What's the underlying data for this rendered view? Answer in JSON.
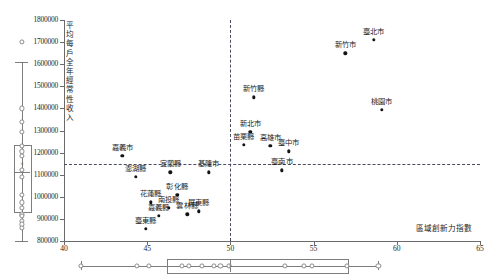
{
  "chart_data": {
    "type": "scatter",
    "title": "",
    "xlabel": "區域創新力指數",
    "ylabel": "平均每戶全年經常性收入",
    "xlim": [
      40,
      65
    ],
    "ylim": [
      800000,
      1800000
    ],
    "xticks": [
      40,
      45,
      50,
      55,
      60,
      65
    ],
    "yticks": [
      800000,
      900000,
      1000000,
      1100000,
      1200000,
      1300000,
      1400000,
      1500000,
      1600000,
      1700000,
      1800000
    ],
    "grid": false,
    "legend": "none",
    "reference_lines": {
      "horizontal_y": 1150000,
      "vertical_x": 50,
      "style": "dashed"
    },
    "points": [
      {
        "label": "臺北市",
        "x": 58.6,
        "y": 1710000
      },
      {
        "label": "新竹市",
        "x": 56.9,
        "y": 1650000
      },
      {
        "label": "桃園市",
        "x": 59.1,
        "y": 1395000
      },
      {
        "label": "新竹縣",
        "x": 51.4,
        "y": 1450000
      },
      {
        "label": "新北市",
        "x": 51.2,
        "y": 1295000
      },
      {
        "label": "苗栗縣",
        "x": 50.8,
        "y": 1235000
      },
      {
        "label": "高雄市",
        "x": 52.4,
        "y": 1230000
      },
      {
        "label": "臺中市",
        "x": 53.5,
        "y": 1205000
      },
      {
        "label": "臺南市",
        "x": 53.1,
        "y": 1120000
      },
      {
        "label": "基隆市",
        "x": 48.7,
        "y": 1110000
      },
      {
        "label": "嘉義市",
        "x": 43.5,
        "y": 1185000
      },
      {
        "label": "澎湖縣",
        "x": 44.3,
        "y": 1090000
      },
      {
        "label": "宜蘭縣",
        "x": 46.4,
        "y": 1110000
      },
      {
        "label": "彰化縣",
        "x": 46.8,
        "y": 1010000
      },
      {
        "label": "花蓮縣",
        "x": 45.2,
        "y": 975000
      },
      {
        "label": "南投縣",
        "x": 46.3,
        "y": 950000
      },
      {
        "label": "嘉義縣",
        "x": 45.7,
        "y": 915000
      },
      {
        "label": "雲林縣",
        "x": 47.4,
        "y": 920000
      },
      {
        "label": "屏東縣",
        "x": 48.1,
        "y": 935000
      },
      {
        "label": "臺東縣",
        "x": 44.9,
        "y": 855000
      }
    ],
    "y_marginal_boxplot": {
      "name": "income-boxplot",
      "min_whisker": 800000,
      "q1": 935000,
      "median": 1110000,
      "q3": 1235000,
      "max_whisker": 1610000,
      "mean": 1150000,
      "mean_marker": "×",
      "outliers": [
        1700000,
        1400000,
        1340000,
        1295000,
        1230000,
        1205000,
        1185000,
        1120000,
        1090000,
        1010000,
        975000,
        950000,
        920000,
        915000,
        890000,
        875000,
        860000
      ]
    },
    "x_marginal_boxplot": {
      "name": "innovation-index-boxplot",
      "min_whisker": 41.0,
      "q1": 46.2,
      "median": 50.0,
      "q3": 57.0,
      "max_whisker": 58.9,
      "mean": 50.0,
      "mean_marker": "×",
      "outliers": [
        41.0,
        44.4,
        45.1,
        47.1,
        47.5,
        48.3,
        49.0,
        49.4,
        49.9,
        53.3,
        54.4,
        54.9,
        57.0,
        58.9
      ]
    }
  },
  "axis": {
    "y_title": "平均每戶全年經常性收入",
    "x_title": "區域創新力指數"
  }
}
